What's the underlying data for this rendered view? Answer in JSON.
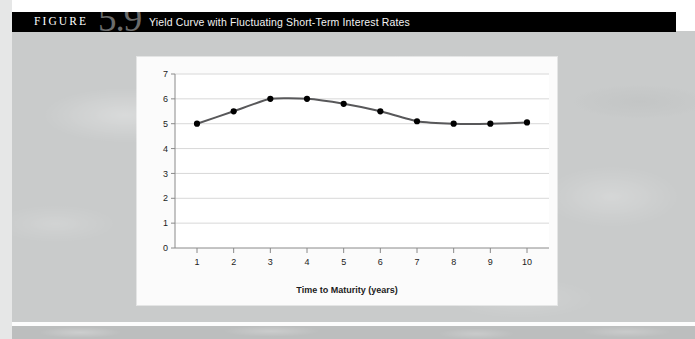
{
  "figure": {
    "label": "FIGURE",
    "number": "5.9",
    "title": "Yield Curve with Fluctuating Short-Term Interest Rates"
  },
  "colors": {
    "header_bar": "#000000",
    "header_label": "#ffffff",
    "header_number": "#6b6b6b",
    "page_background": "#c9cbcb",
    "panel_background": "#fbfbfb",
    "line": "#58585a",
    "marker": "#000000",
    "gridline": "#d8d8d8",
    "axis": "#8a8a8a",
    "tick_text": "#1c1c1c"
  },
  "chart_data": {
    "type": "line",
    "title": "",
    "xlabel": "Time to Maturity (years)",
    "ylabel": "Yield to Maturity (percent)",
    "x": [
      1,
      2,
      3,
      4,
      5,
      6,
      7,
      8,
      9,
      10
    ],
    "values": [
      5.0,
      5.5,
      6.0,
      6.0,
      5.8,
      5.5,
      5.1,
      5.0,
      5.0,
      5.05
    ],
    "xlim": [
      0.4,
      10.6
    ],
    "ylim": [
      0,
      7
    ],
    "xticks": [
      1,
      2,
      3,
      4,
      5,
      6,
      7,
      8,
      9,
      10
    ],
    "xtick_labels": [
      "1",
      "2",
      "3",
      "4",
      "5",
      "6",
      "7",
      "8",
      "9",
      "10"
    ],
    "yticks": [
      0,
      1,
      2,
      3,
      4,
      5,
      6,
      7
    ],
    "ytick_labels": [
      "0",
      "1",
      "2",
      "3",
      "4",
      "5",
      "6",
      "7"
    ],
    "grid": "horizontal",
    "legend": null,
    "markers": "filled-circle",
    "series": [
      {
        "name": "Yield to Maturity",
        "values": [
          5.0,
          5.5,
          6.0,
          6.0,
          5.8,
          5.5,
          5.1,
          5.0,
          5.0,
          5.05
        ]
      }
    ]
  }
}
